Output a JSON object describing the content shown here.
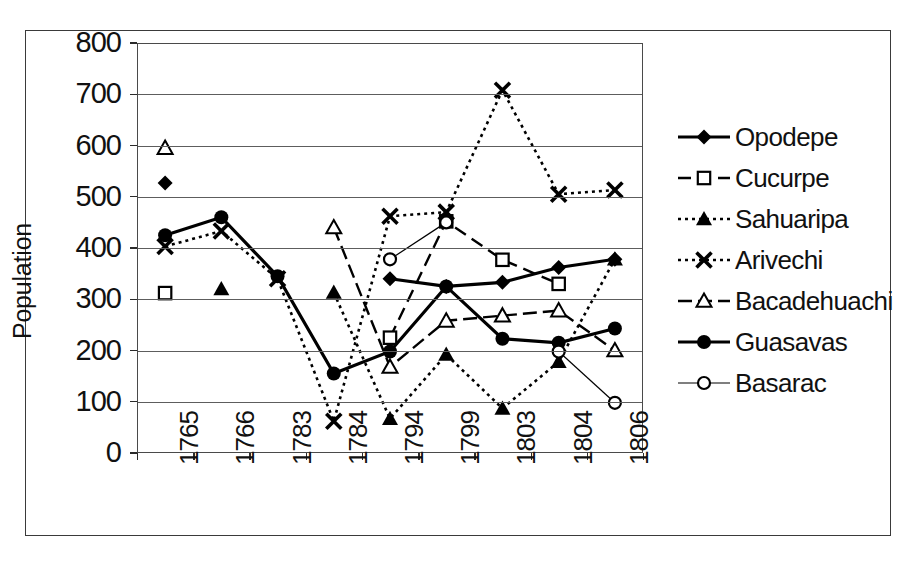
{
  "chart_data": {
    "type": "line",
    "title": "",
    "xlabel": "",
    "ylabel": "Population",
    "categories": [
      "1765",
      "1766",
      "1783",
      "1784",
      "1794",
      "1799",
      "1803",
      "1804",
      "1806"
    ],
    "ylim": [
      0,
      800
    ],
    "y_ticks": [
      0,
      100,
      200,
      300,
      400,
      500,
      600,
      700,
      800
    ],
    "grid": true,
    "legend_position": "right",
    "series": [
      {
        "name": "Opodepe",
        "marker": "filled-diamond",
        "line_style": "solid",
        "values": [
          527,
          null,
          null,
          null,
          340,
          325,
          333,
          362,
          378
        ]
      },
      {
        "name": "Cucurpe",
        "marker": "open-square",
        "line_style": "dashed",
        "values": [
          312,
          null,
          null,
          null,
          225,
          452,
          377,
          330,
          null
        ]
      },
      {
        "name": "Sahuaripa",
        "marker": "filled-triangle",
        "line_style": "dotted",
        "values": [
          null,
          320,
          null,
          313,
          67,
          192,
          87,
          178,
          378
        ]
      },
      {
        "name": "Arivechi",
        "marker": "cross-x",
        "line_style": "dotted",
        "values": [
          403,
          433,
          340,
          62,
          462,
          470,
          708,
          505,
          513
        ]
      },
      {
        "name": "Bacadehuachi",
        "marker": "open-triangle",
        "line_style": "dash-dot",
        "values": [
          595,
          null,
          null,
          440,
          168,
          258,
          268,
          278,
          200
        ]
      },
      {
        "name": "Guasavas",
        "marker": "filled-circle",
        "line_style": "solid",
        "values": [
          425,
          460,
          345,
          155,
          198,
          325,
          223,
          215,
          243
        ]
      },
      {
        "name": "Basarac",
        "marker": "open-circle",
        "line_style": "thin-solid",
        "values": [
          null,
          null,
          null,
          null,
          378,
          450,
          null,
          198,
          98
        ]
      }
    ]
  }
}
